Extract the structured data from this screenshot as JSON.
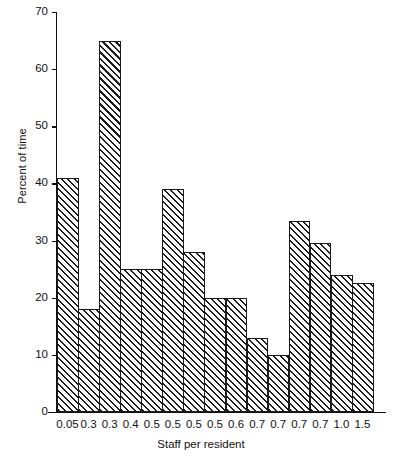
{
  "chart_data": {
    "type": "bar",
    "title": "",
    "subtitle": "",
    "xlabel": "Staff per resident",
    "ylabel": "Percent of time",
    "categories": [
      "0.05",
      "0.3",
      "0.3",
      "0.4",
      "0.5",
      "0.5",
      "0.5",
      "0.5",
      "0.6",
      "0.7",
      "0.7",
      "0.7",
      "0.7",
      "1.0",
      "1.5"
    ],
    "values": [
      41,
      18,
      65,
      25,
      25,
      39,
      28,
      20,
      20,
      13,
      10,
      33.5,
      29.5,
      24,
      22.5
    ],
    "ylim": [
      0,
      70
    ],
    "yticks": [
      0,
      10,
      20,
      30,
      40,
      50,
      60,
      70
    ],
    "ytick_labels": [
      "0",
      "10",
      "20",
      "30",
      "40",
      "50",
      "60",
      "70"
    ],
    "grid": false,
    "legend": null,
    "legend_position": "none",
    "bar_style": {
      "fill": "diagonal-hatch",
      "hatch_color": "#1c1c1c",
      "background_color": "#ffffff",
      "edge_color": "#1a1a1a"
    },
    "axis_color": "#111111",
    "plot_background": "#ffffff"
  }
}
